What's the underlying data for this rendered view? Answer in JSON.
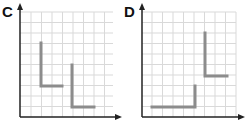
{
  "panels": [
    {
      "label": "C",
      "origin": [
        20,
        117
      ],
      "grid": {
        "x0": 31,
        "x1": 113,
        "y0": 12,
        "y1": 117,
        "step": 10.5,
        "color": "#d9d9d9"
      },
      "axis_color": "#222222",
      "shapes": [
        {
          "points": [
            [
              41,
              43
            ],
            [
              41,
              86
            ],
            [
              62,
              86
            ]
          ]
        },
        {
          "points": [
            [
              72,
              65
            ],
            [
              72,
              107
            ],
            [
              94,
              107
            ]
          ]
        }
      ],
      "shape_color": "#8c8c8c"
    },
    {
      "label": "D",
      "origin": [
        142,
        117
      ],
      "grid": {
        "x0": 152,
        "x1": 236,
        "y0": 12,
        "y1": 117,
        "step": 10.5,
        "color": "#d9d9d9"
      },
      "axis_color": "#222222",
      "shapes": [
        {
          "points": [
            [
              152,
              107
            ],
            [
              195,
              107
            ],
            [
              195,
              86
            ]
          ]
        },
        {
          "points": [
            [
              205,
              33
            ],
            [
              205,
              76
            ],
            [
              227,
              76
            ]
          ]
        }
      ],
      "shape_color": "#8c8c8c"
    }
  ]
}
